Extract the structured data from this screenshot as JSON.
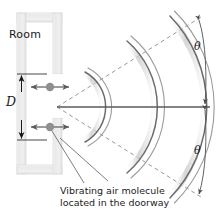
{
  "figure": {
    "width": 217,
    "height": 214,
    "background": "#ffffff"
  },
  "labels": {
    "room": "Room",
    "doorway_width": "D",
    "theta_top": "θ",
    "theta_bottom": "θ"
  },
  "caption": {
    "line1": "Vibrating air molecule",
    "line2": "located in the doorway"
  },
  "colors": {
    "wall_fill": "#ededed",
    "wall_edge": "#cfcfcf",
    "wall_highlight": "#fafafa",
    "wavefront_line": "#6e6e6e",
    "wavefront_shade": "#cfcfcf",
    "axis_line": "#5a5a5a",
    "dashed_line": "#8a8a8a",
    "molecule_dot": "#8a8a8a",
    "molecule_arrow": "#5a5a5a",
    "dimension_line": "#1a1a1a",
    "text": "#1a1a1a",
    "leader_line": "#6e6e6e"
  },
  "geometry": {
    "source_x": 57,
    "source_y": 107,
    "doorway_top_y": 74,
    "doorway_bottom_y": 118,
    "spread_half_angle_deg": 42,
    "wavefront_radii": [
      38,
      84,
      128
    ]
  },
  "elements": {
    "room_outline": "room-wall",
    "doorway_gap": "doorway-opening",
    "molecules": 2,
    "wavefronts": 3,
    "angle_arcs": 2,
    "dashed_boundaries": 2
  }
}
